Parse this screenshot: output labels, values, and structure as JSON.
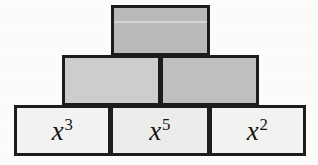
{
  "figure": {
    "name": "block-pyramid",
    "background_color": "#fcfcfb",
    "border_color": "#1c1c1c"
  },
  "rows": {
    "top": {
      "blocks": [
        {
          "id": "top",
          "label": "",
          "base": "",
          "exponent": "",
          "filled": false,
          "fill_color": "#b9b9b9"
        }
      ]
    },
    "middle": {
      "blocks": [
        {
          "id": "mid-left",
          "label": "",
          "base": "",
          "exponent": "",
          "filled": false,
          "fill_color": "#cdcdcd"
        },
        {
          "id": "mid-right",
          "label": "",
          "base": "",
          "exponent": "",
          "filled": false,
          "fill_color": "#bfbfbf"
        }
      ]
    },
    "bottom": {
      "blocks": [
        {
          "id": "bottom-left",
          "label": "x3",
          "base": "x",
          "exponent": "3",
          "filled": true,
          "fill_color": "#f2f2f0"
        },
        {
          "id": "bottom-middle",
          "label": "x5",
          "base": "x",
          "exponent": "5",
          "filled": true,
          "fill_color": "#ececeb"
        },
        {
          "id": "bottom-right",
          "label": "x2",
          "base": "x",
          "exponent": "2",
          "filled": true,
          "fill_color": "#f2f2f0"
        }
      ]
    }
  }
}
